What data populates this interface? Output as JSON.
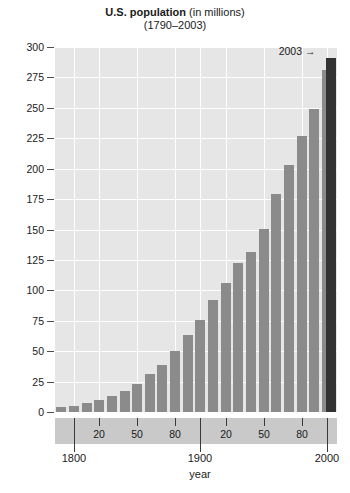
{
  "chart_data": {
    "type": "bar",
    "title": "U.S. population (in millions)",
    "title_main": "U.S. population",
    "title_sub": " (in millions)",
    "subtitle": "(1790–2003)",
    "xlabel": "year",
    "ylabel": "",
    "xlim": [
      1785,
      2008
    ],
    "ylim": [
      0,
      300
    ],
    "grid": true,
    "legend": false,
    "bar_color": "#8b8b8b",
    "highlight_color": "#333333",
    "plot_background": "#e6e6e6",
    "gridline_color": "#ffffff",
    "axis_strip_color": "#c9c9c9",
    "categories": [
      1790,
      1800,
      1810,
      1820,
      1830,
      1840,
      1850,
      1860,
      1870,
      1880,
      1890,
      1900,
      1910,
      1920,
      1930,
      1940,
      1950,
      1960,
      1970,
      1980,
      1990,
      2000,
      2003
    ],
    "values": [
      3.9,
      5.3,
      7.2,
      9.6,
      12.9,
      17.1,
      23.2,
      31.4,
      38.6,
      50.2,
      62.9,
      76.0,
      92.0,
      105.7,
      122.8,
      131.7,
      150.7,
      179.3,
      203.3,
      226.5,
      248.7,
      281.4,
      290.8
    ],
    "highlight_index": 22,
    "yticks": [
      0,
      25,
      50,
      75,
      100,
      125,
      150,
      175,
      200,
      225,
      250,
      275,
      300
    ],
    "ytick_labels": [
      "0",
      "25",
      "50",
      "75",
      "100",
      "125",
      "150",
      "175",
      "200",
      "225",
      "250",
      "275",
      "300"
    ],
    "x_minor_ticks": [
      1820,
      1850,
      1880,
      1920,
      1950,
      1980
    ],
    "x_minor_labels": [
      "20",
      "50",
      "80",
      "20",
      "50",
      "80"
    ],
    "x_major_ticks": [
      1800,
      1900,
      2000
    ],
    "x_major_labels": [
      "1800",
      "1900",
      "2000"
    ],
    "annotation": {
      "label": "2003",
      "arrow": "→",
      "year": 2003
    }
  }
}
